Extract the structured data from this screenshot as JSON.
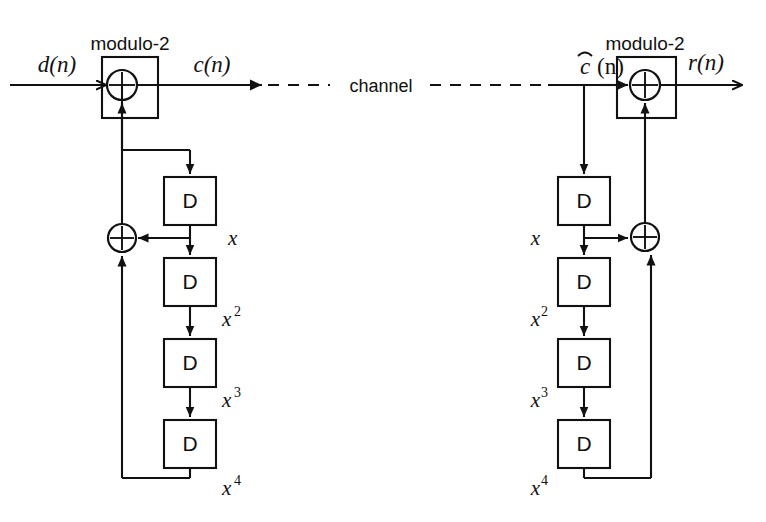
{
  "figure": {
    "type": "block-diagram",
    "background_color": "#ffffff",
    "line_color": "#111111"
  },
  "signals": {
    "input": "d(n)",
    "scrambled": "c(n)",
    "channel": "channel",
    "received_base": "c",
    "received_suffix": "(n)",
    "received_full": "ĉ(n)",
    "output": "r(n)"
  },
  "scrambler": {
    "adder_label": "modulo-2",
    "adder_symbol": "+",
    "feedback_adder_symbol": "+",
    "delays": [
      {
        "label": "D",
        "tap": "x",
        "tap_base": "x",
        "tap_exp": ""
      },
      {
        "label": "D",
        "tap": "x2",
        "tap_base": "x",
        "tap_exp": "2"
      },
      {
        "label": "D",
        "tap": "x3",
        "tap_base": "x",
        "tap_exp": "3"
      },
      {
        "label": "D",
        "tap": "x4",
        "tap_base": "x",
        "tap_exp": "4"
      }
    ]
  },
  "descrambler": {
    "adder_label": "modulo-2",
    "adder_symbol": "+",
    "feedback_adder_symbol": "+",
    "delays": [
      {
        "label": "D",
        "tap": "x",
        "tap_base": "x",
        "tap_exp": ""
      },
      {
        "label": "D",
        "tap": "x2",
        "tap_base": "x",
        "tap_exp": "2"
      },
      {
        "label": "D",
        "tap": "x3",
        "tap_base": "x",
        "tap_exp": "3"
      },
      {
        "label": "D",
        "tap": "x4",
        "tap_base": "x",
        "tap_exp": "4"
      }
    ]
  }
}
